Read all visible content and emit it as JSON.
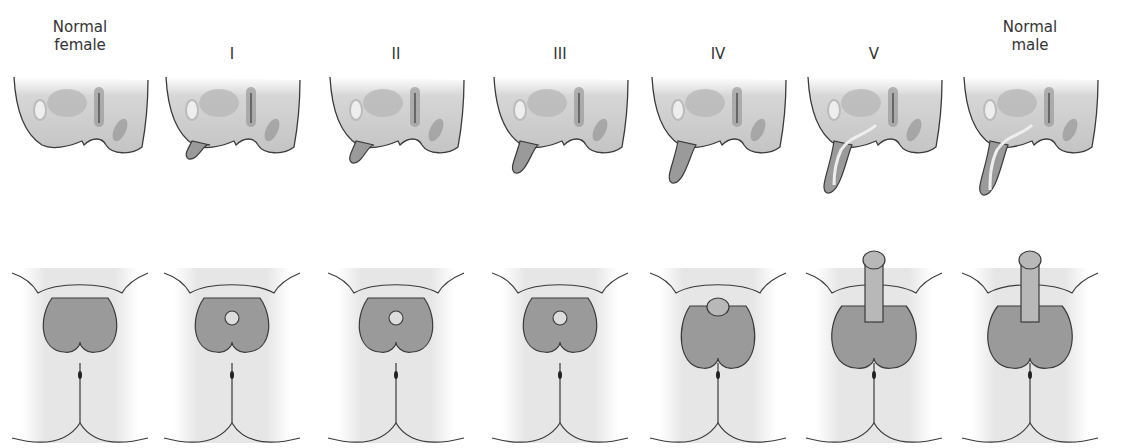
{
  "figure": {
    "stages": [
      {
        "key": "normal-female",
        "label": "Normal\nfemale"
      },
      {
        "key": "stage-1",
        "label": "I"
      },
      {
        "key": "stage-2",
        "label": "II"
      },
      {
        "key": "stage-3",
        "label": "III"
      },
      {
        "key": "stage-4",
        "label": "IV"
      },
      {
        "key": "stage-5",
        "label": "V"
      },
      {
        "key": "normal-male",
        "label": "Normal\nmale"
      }
    ],
    "rows": [
      "sagittal-view",
      "external-view"
    ],
    "colors": {
      "outline": "#3a3a3a",
      "tissue_dark": "#9a9a9a",
      "tissue_mid": "#b8b8b8",
      "skin_light": "#e4e4e4",
      "background": "#ffffff"
    }
  }
}
